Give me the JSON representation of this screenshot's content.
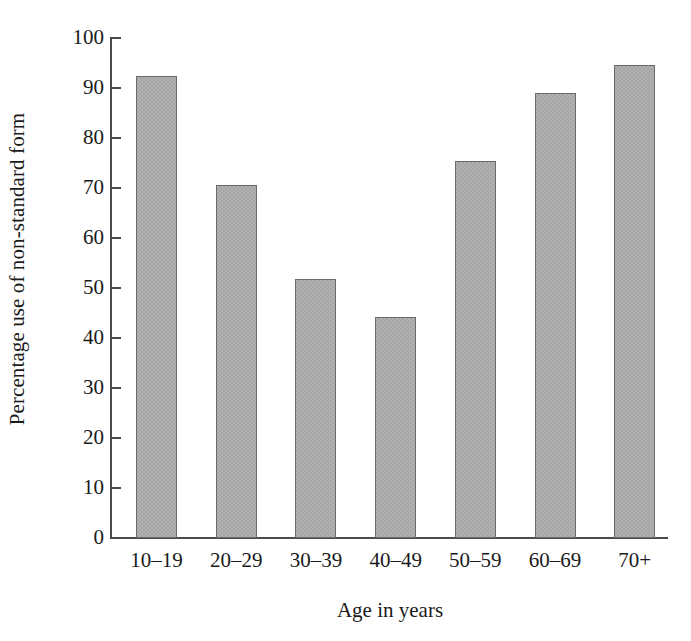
{
  "chart_data": {
    "type": "bar",
    "title": "",
    "xlabel": "Age in years",
    "ylabel": "Percentage use of non-standard form",
    "categories": [
      "10–19",
      "20–29",
      "30–39",
      "40–49",
      "50–59",
      "60–69",
      "70+"
    ],
    "values": [
      92.4,
      70.6,
      51.8,
      44.2,
      75.4,
      89.0,
      94.6
    ],
    "ylim": [
      0,
      100
    ],
    "yticks": [
      0,
      10,
      20,
      30,
      40,
      50,
      60,
      70,
      80,
      90,
      100
    ],
    "ytick_labels": [
      "0",
      "10",
      "20",
      "30",
      "40",
      "50",
      "60",
      "70",
      "80",
      "90",
      "100"
    ],
    "grid": false,
    "legend": null,
    "bar_color": "#aaaaaa",
    "bar_edge_color": "#6a6a6a",
    "axis_color": "#4a4a4a",
    "background": "#ffffff"
  }
}
